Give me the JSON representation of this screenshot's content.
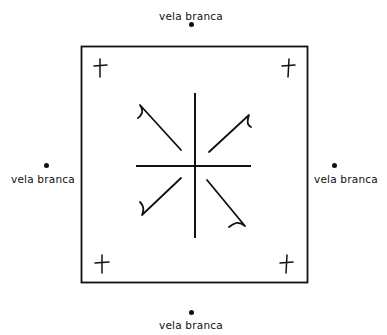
{
  "diagram": {
    "type": "ritual-diagram",
    "stroke_color": "#111111",
    "background": "#ffffff",
    "candles": [
      {
        "position": "top",
        "label": "vela branca",
        "icon": "dot-icon"
      },
      {
        "position": "left",
        "label": "vela branca",
        "icon": "dot-icon"
      },
      {
        "position": "right",
        "label": "vela branca",
        "icon": "dot-icon"
      },
      {
        "position": "bottom",
        "label": "vela branca",
        "icon": "dot-icon"
      }
    ],
    "square": {
      "shape": "square",
      "description": "outer square frame"
    },
    "corner_crosses": [
      {
        "corner": "top-left",
        "icon": "cross-icon"
      },
      {
        "corner": "top-right",
        "icon": "cross-icon"
      },
      {
        "corner": "bottom-left",
        "icon": "cross-icon"
      },
      {
        "corner": "bottom-right",
        "icon": "cross-icon"
      }
    ],
    "center_symbol": {
      "description": "central cross with four hooked diagonal arrows pointing outward",
      "arrows": [
        "upper-left",
        "upper-right",
        "lower-left",
        "lower-right"
      ]
    }
  }
}
